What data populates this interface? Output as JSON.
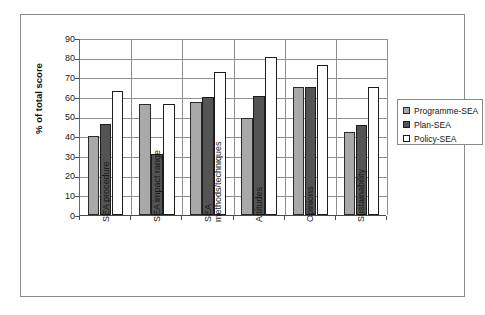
{
  "chart_data": {
    "type": "bar",
    "title": "",
    "xlabel": "",
    "ylabel": "% of total score",
    "ylim": [
      0,
      90
    ],
    "yticks": [
      0,
      10,
      20,
      30,
      40,
      50,
      60,
      70,
      80,
      90
    ],
    "grid": true,
    "legend_position": "right",
    "categories": [
      "SEA procedure",
      "SEA impact range",
      "SEA methods/techniques",
      "Attitudes",
      "Opinions",
      "Sustainability"
    ],
    "category_lines": [
      [
        "SEA procedure"
      ],
      [
        "SEA impact range"
      ],
      [
        "SEA",
        "methods/techniques"
      ],
      [
        "Attitudes"
      ],
      [
        "Opinions"
      ],
      [
        "Sustainability"
      ]
    ],
    "series": [
      {
        "name": "Programme-SEA",
        "color": "#a9a9a9",
        "values": [
          40,
          56.5,
          57.5,
          49.5,
          65,
          42
        ]
      },
      {
        "name": "Plan-SEA",
        "color": "#545454",
        "values": [
          46.5,
          31,
          60,
          60.5,
          65,
          46
        ]
      },
      {
        "name": "Policy-SEA",
        "color": "#ffffff",
        "values": [
          63,
          56.5,
          72.5,
          80.5,
          76.5,
          65
        ]
      }
    ]
  },
  "legend": {
    "items": [
      {
        "label": "Programme-SEA",
        "swatch": "programme"
      },
      {
        "label": "Plan-SEA",
        "swatch": "plan"
      },
      {
        "label": "Policy-SEA",
        "swatch": "policy"
      }
    ]
  }
}
